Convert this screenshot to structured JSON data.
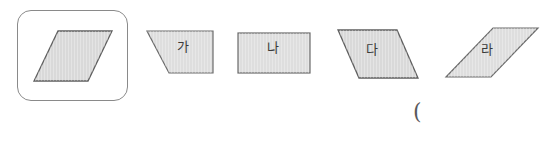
{
  "worksheet": {
    "type": "geometry-shape-identification",
    "background_color": "#ffffff",
    "reference": {
      "name": "reference-parallelogram",
      "shape": "parallelogram",
      "highlighted": true,
      "card_border_color": "#8a8a8a",
      "fill_color": "#d9d9d9",
      "stroke_color": "#5f5f5f",
      "label": ""
    },
    "options": [
      {
        "key": "ga",
        "label": "가",
        "shape": "trapezoid",
        "fill_color": "#dedede",
        "stroke_color": "#6b6b6b"
      },
      {
        "key": "na",
        "label": "나",
        "shape": "rectangle",
        "fill_color": "#dedede",
        "stroke_color": "#6b6b6b"
      },
      {
        "key": "da",
        "label": "다",
        "shape": "parallelogram",
        "fill_color": "#d9d9d9",
        "stroke_color": "#5f5f5f"
      },
      {
        "key": "ra",
        "label": "라",
        "shape": "parallelogram",
        "fill_color": "#e2e2e2",
        "stroke_color": "#6b6b6b"
      }
    ],
    "answer_mark": "("
  }
}
